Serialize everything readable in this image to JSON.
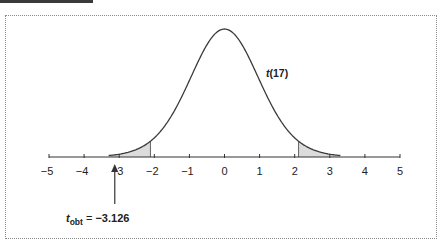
{
  "header": {
    "bar_color": "#3a3a3a"
  },
  "chart_data": {
    "type": "area",
    "title": "",
    "distribution": "t",
    "df": 17,
    "distribution_label_prefix": "t",
    "distribution_label_suffix": "(17)",
    "x_range": [
      -5,
      5
    ],
    "curve_domain": [
      -3.3,
      3.3
    ],
    "xticks": [
      -5,
      -4,
      -3,
      -2,
      -1,
      0,
      1,
      2,
      3,
      4,
      5
    ],
    "xtick_labels": [
      "−5",
      "−4",
      "−3",
      "−2",
      "−1",
      "0",
      "1",
      "2",
      "3",
      "4",
      "5"
    ],
    "critical_values": [
      -2.11,
      2.11
    ],
    "shaded_regions": [
      {
        "from": -3.3,
        "to": -2.11,
        "label": "left rejection region"
      },
      {
        "from": 2.11,
        "to": 3.3,
        "label": "right rejection region"
      }
    ],
    "annotation": {
      "symbol": "t",
      "subscript": "obt",
      "equals": " = ",
      "value_text": "−3.126",
      "value": -3.126,
      "arrow": "up"
    },
    "xlabel": "",
    "ylabel": "",
    "grid": false,
    "legend": "none",
    "colors": {
      "curve": "#3b3b3b",
      "shade": "#dcdcdc",
      "axis": "#333333",
      "text": "#222222"
    }
  }
}
